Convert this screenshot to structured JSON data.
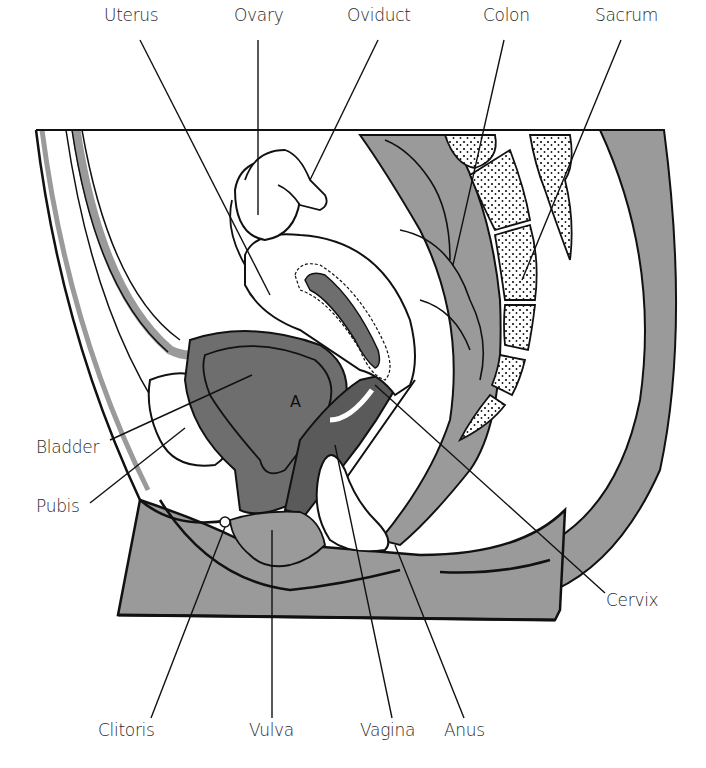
{
  "diagram": {
    "type": "anatomical-sagittal-section",
    "colors": {
      "tissue_gray": "#9a9a9a",
      "dark_gray": "#6e6e6e",
      "outline": "#111111",
      "background": "#ffffff"
    },
    "labels": {
      "uterus": "Uterus",
      "ovary": "Ovary",
      "oviduct": "Oviduct",
      "colon": "Colon",
      "sacrum": "Sacrum",
      "bladder": "Bladder",
      "pubis": "Pubis",
      "cervix": "Cervix",
      "clitoris": "Clitoris",
      "vulva": "Vulva",
      "vagina": "Vagina",
      "anus": "Anus"
    },
    "bladder_mark": "A"
  }
}
